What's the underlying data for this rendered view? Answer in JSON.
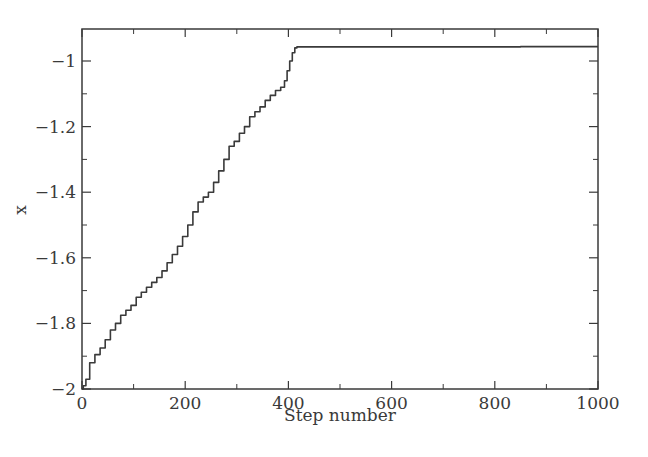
{
  "chart_data": {
    "type": "line",
    "title": "",
    "xlabel": "Step number",
    "ylabel": "x",
    "xlim": [
      0,
      1000
    ],
    "ylim": [
      -2,
      -0.9
    ],
    "grid": false,
    "legend": null,
    "x_ticks": [
      0,
      200,
      400,
      600,
      800,
      1000
    ],
    "x_tick_labels": [
      "0",
      "200",
      "400",
      "600",
      "800",
      "1000"
    ],
    "y_ticks": [
      -2,
      -1.8,
      -1.6,
      -1.4,
      -1.2,
      -1
    ],
    "y_tick_labels": [
      "−2",
      "−1.8",
      "−1.6",
      "−1.4",
      "−1.2",
      "−1"
    ],
    "series": [
      {
        "name": "x",
        "color": "#3a3a3a",
        "x": [
          0,
          5,
          10,
          20,
          30,
          40,
          50,
          60,
          70,
          80,
          90,
          100,
          110,
          120,
          130,
          140,
          150,
          160,
          170,
          180,
          190,
          200,
          210,
          220,
          230,
          240,
          250,
          260,
          270,
          280,
          290,
          300,
          310,
          320,
          330,
          340,
          350,
          360,
          370,
          380,
          390,
          395,
          400,
          405,
          410,
          415,
          418,
          500,
          600,
          700,
          800,
          900,
          1000
        ],
        "y": [
          -2.0,
          -1.99,
          -1.97,
          -1.92,
          -1.895,
          -1.875,
          -1.85,
          -1.82,
          -1.8,
          -1.775,
          -1.76,
          -1.745,
          -1.72,
          -1.705,
          -1.69,
          -1.675,
          -1.66,
          -1.64,
          -1.615,
          -1.59,
          -1.565,
          -1.535,
          -1.5,
          -1.46,
          -1.43,
          -1.415,
          -1.4,
          -1.37,
          -1.335,
          -1.3,
          -1.26,
          -1.245,
          -1.22,
          -1.2,
          -1.17,
          -1.155,
          -1.14,
          -1.12,
          -1.105,
          -1.09,
          -1.08,
          -1.06,
          -1.03,
          -1.0,
          -0.975,
          -0.96,
          -0.957,
          -0.957,
          -0.957,
          -0.957,
          -0.957,
          -0.956,
          -0.956
        ]
      }
    ]
  }
}
